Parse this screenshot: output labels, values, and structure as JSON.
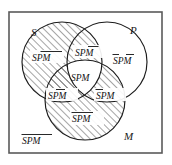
{
  "figure": {
    "type": "venn-diagram",
    "sets": 3,
    "universe_label": "",
    "circle_labels": {
      "s": "S",
      "p": "P",
      "m": "M"
    },
    "base_symbols": [
      "S",
      "P",
      "M"
    ],
    "regions": [
      {
        "id": "s-only",
        "name": "s-only-region",
        "text": "SPM",
        "bars": [
          false,
          true,
          true
        ],
        "bar_style": "separate",
        "shaded": true
      },
      {
        "id": "s-and-p",
        "name": "s-and-p-region",
        "text": "SPM",
        "bars": [
          false,
          false,
          true
        ],
        "bar_style": "separate",
        "shaded": true
      },
      {
        "id": "p-only",
        "name": "p-only-region",
        "text": "SPM",
        "bars": [
          true,
          false,
          true
        ],
        "bar_style": "separate",
        "shaded": false
      },
      {
        "id": "s-and-p-and-m",
        "name": "center-region",
        "text": "SPM",
        "bars": [
          false,
          false,
          false
        ],
        "bar_style": "none",
        "shaded": false
      },
      {
        "id": "s-and-m",
        "name": "s-and-m-region",
        "text": "SPM",
        "bars": [
          false,
          true,
          false
        ],
        "bar_style": "separate",
        "shaded": true
      },
      {
        "id": "p-and-m",
        "name": "p-and-m-region",
        "text": "SPM",
        "bars": [
          true,
          false,
          false
        ],
        "bar_style": "separate",
        "shaded": true
      },
      {
        "id": "m-only",
        "name": "m-only-region",
        "text": "SPM",
        "bars": [
          true,
          true,
          false
        ],
        "bar_style": "joined-sp",
        "shaded": true
      },
      {
        "id": "outside",
        "name": "outside-region",
        "text": "SPM",
        "bars": [
          true,
          true,
          true
        ],
        "bar_style": "full",
        "shaded": false
      }
    ],
    "colors": {
      "ink": "#1b1b1b",
      "box_stroke": "#5a5a5a",
      "hatch": "#2b2b2b",
      "background": "#ffffff"
    },
    "geometry": {
      "box": {
        "x": 9,
        "y": 12,
        "w": 153,
        "h": 141
      },
      "circle_s": {
        "cx": 62,
        "cy": 62,
        "r": 40
      },
      "circle_p": {
        "cx": 107,
        "cy": 62,
        "r": 40
      },
      "circle_m": {
        "cx": 85,
        "cy": 100,
        "r": 40
      }
    }
  }
}
